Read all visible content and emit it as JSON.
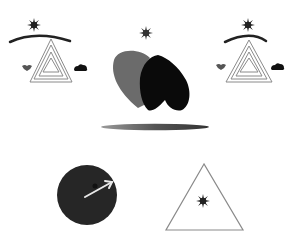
{
  "scene": {
    "background": "#ffffff",
    "description": "Abstract symbol illustration",
    "groups": [
      {
        "id": "left-emblem",
        "label": "Left triangle emblem",
        "cx": 42
      },
      {
        "id": "center-hearts",
        "label": "Center hearts with star and bar"
      },
      {
        "id": "right-emblem",
        "label": "Right triangle emblem",
        "cx": 250
      },
      {
        "id": "dark-circle",
        "label": "Dark circle with arrow"
      },
      {
        "id": "star-triangle",
        "label": "Triangle with star"
      }
    ]
  },
  "colors": {
    "dark": "#111111",
    "gray": "#6b6b6b",
    "outline": "#8a8a8a",
    "circle": "#262626",
    "arrow": "#e8e8e8"
  },
  "icons": [
    "star-icon",
    "arc-icon",
    "nested-triangle-icon",
    "small-heart-icon",
    "cloud-icon",
    "heart-icon",
    "bar-icon",
    "circle-icon",
    "arrow-icon",
    "triangle-icon"
  ]
}
